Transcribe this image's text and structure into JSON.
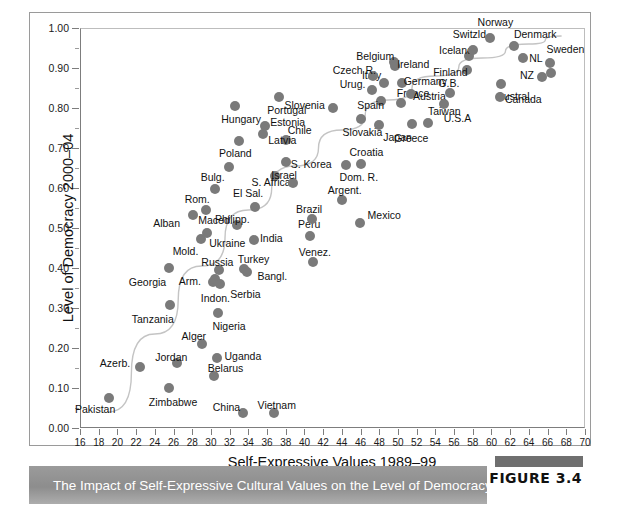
{
  "figure": {
    "caption": "The Impact of Self-Expressive Cultural Values on the Level of Democracy",
    "number_label": "FIGURE 3.4"
  },
  "chart_data": {
    "type": "scatter",
    "title": "",
    "xlabel": "Self-Expressive Values 1989–99",
    "ylabel": "Level of Democracy 2000–04",
    "xlim": [
      16,
      70
    ],
    "ylim": [
      0.0,
      1.0
    ],
    "xticks": [
      16,
      18,
      20,
      22,
      24,
      26,
      28,
      30,
      32,
      34,
      36,
      38,
      40,
      42,
      44,
      46,
      48,
      50,
      52,
      54,
      56,
      58,
      60,
      62,
      64,
      66,
      68,
      70
    ],
    "xtick_labels": [
      "16",
      "18",
      "20",
      "22",
      "24",
      "26",
      "28",
      "30",
      "32",
      "34",
      "36",
      "38",
      "40",
      "42",
      "44",
      "46",
      "48",
      "50",
      "52",
      "54",
      "56",
      "58",
      "60",
      "62",
      "64",
      "66",
      "68",
      "70"
    ],
    "yticks": [
      0.0,
      0.1,
      0.2,
      0.3,
      0.4,
      0.5,
      0.6,
      0.7,
      0.8,
      0.9,
      1.0
    ],
    "ytick_labels": [
      "0.00",
      "0.10",
      "0.20",
      "0.30",
      "0.40",
      "0.50",
      "0.60",
      "0.70",
      "0.80",
      "0.90",
      "1.00"
    ],
    "grid": false,
    "legend": "none",
    "marker_color": "#7a7a7a",
    "trendline": {
      "present": true,
      "color": "#c4c4c4",
      "description": "upward curving fitted line from lower-left to upper-right"
    },
    "points": [
      {
        "label": "Pakistan",
        "x": 19.1,
        "y": 0.075,
        "lx": -34,
        "ly": 11
      },
      {
        "label": "Azerb.",
        "x": 22.4,
        "y": 0.152,
        "lx": -40,
        "ly": -4
      },
      {
        "label": "Zimbabwe",
        "x": 25.5,
        "y": 0.1,
        "lx": -20,
        "ly": 14
      },
      {
        "label": "Tanzania",
        "x": 25.6,
        "y": 0.308,
        "lx": -38,
        "ly": 14
      },
      {
        "label": "Georgia",
        "x": 25.5,
        "y": 0.4,
        "lx": -40,
        "ly": 14
      },
      {
        "label": "Jordan",
        "x": 26.4,
        "y": 0.162,
        "lx": -22,
        "ly": -6
      },
      {
        "label": "Alger",
        "x": 29.0,
        "y": 0.21,
        "lx": -20,
        "ly": -8
      },
      {
        "label": "Belarus",
        "x": 30.3,
        "y": 0.13,
        "lx": -6,
        "ly": -8
      },
      {
        "label": "Uganda",
        "x": 30.7,
        "y": 0.176,
        "lx": 7,
        "ly": -2
      },
      {
        "label": "Nigeria",
        "x": 30.8,
        "y": 0.288,
        "lx": -6,
        "ly": 13
      },
      {
        "label": "China",
        "x": 33.4,
        "y": 0.037,
        "lx": -30,
        "ly": -6
      },
      {
        "label": "Vietnam",
        "x": 36.7,
        "y": 0.037,
        "lx": -16,
        "ly": -8
      },
      {
        "label": "Indon.",
        "x": 30.2,
        "y": 0.365,
        "lx": -12,
        "ly": 16
      },
      {
        "label": "Arm.",
        "x": 30.4,
        "y": 0.372,
        "lx": -36,
        "ly": 2
      },
      {
        "label": "Serbia",
        "x": 31.0,
        "y": 0.36,
        "lx": 10,
        "ly": 10
      },
      {
        "label": "Russia",
        "x": 30.9,
        "y": 0.395,
        "lx": -18,
        "ly": -8
      },
      {
        "label": "Bangl.",
        "x": 33.9,
        "y": 0.39,
        "lx": 10,
        "ly": 4
      },
      {
        "label": "Turkey",
        "x": 33.5,
        "y": 0.398,
        "lx": -6,
        "ly": -10
      },
      {
        "label": "Venez.",
        "x": 40.9,
        "y": 0.415,
        "lx": -14,
        "ly": -10
      },
      {
        "label": "Mold.",
        "x": 28.9,
        "y": 0.473,
        "lx": -28,
        "ly": 12
      },
      {
        "label": "Ukraine",
        "x": 29.6,
        "y": 0.488,
        "lx": 2,
        "ly": 10
      },
      {
        "label": "India",
        "x": 34.6,
        "y": 0.47,
        "lx": 6,
        "ly": -2
      },
      {
        "label": "Alban",
        "x": 28.1,
        "y": 0.532,
        "lx": -40,
        "ly": 8
      },
      {
        "label": "Maced.",
        "x": 29.5,
        "y": 0.545,
        "lx": -8,
        "ly": 10
      },
      {
        "label": "Philipp.",
        "x": 32.8,
        "y": 0.508,
        "lx": -22,
        "ly": -6
      },
      {
        "label": "Peru",
        "x": 40.6,
        "y": 0.48,
        "lx": -12,
        "ly": -12
      },
      {
        "label": "Brazil",
        "x": 40.8,
        "y": 0.523,
        "lx": -16,
        "ly": -10
      },
      {
        "label": "Mexico",
        "x": 45.9,
        "y": 0.512,
        "lx": 8,
        "ly": -8
      },
      {
        "label": "Rom.",
        "x": 30.4,
        "y": 0.598,
        "lx": -30,
        "ly": 10
      },
      {
        "label": "El Sal.",
        "x": 34.7,
        "y": 0.552,
        "lx": -22,
        "ly": -14
      },
      {
        "label": "S. Africa",
        "x": 36.9,
        "y": 0.63,
        "lx": -24,
        "ly": 6
      },
      {
        "label": "Bulg.",
        "x": 31.9,
        "y": 0.652,
        "lx": -28,
        "ly": 10
      },
      {
        "label": "Argent.",
        "x": 44.0,
        "y": 0.57,
        "lx": -14,
        "ly": -10
      },
      {
        "label": "Dom. R.",
        "x": 44.4,
        "y": 0.658,
        "lx": -6,
        "ly": 12
      },
      {
        "label": "Israel",
        "x": 38.8,
        "y": 0.612,
        "lx": -22,
        "ly": -8
      },
      {
        "label": "S. Korea",
        "x": 38.0,
        "y": 0.665,
        "lx": 5,
        "ly": 2
      },
      {
        "label": "Chile",
        "x": 38.0,
        "y": 0.72,
        "lx": 2,
        "ly": -10
      },
      {
        "label": "Croatia",
        "x": 46.1,
        "y": 0.66,
        "lx": -12,
        "ly": -12
      },
      {
        "label": "Poland",
        "x": 33.0,
        "y": 0.718,
        "lx": -20,
        "ly": 12
      },
      {
        "label": "Latvia",
        "x": 35.6,
        "y": 0.735,
        "lx": 5,
        "ly": 6
      },
      {
        "label": "Estonia",
        "x": 35.8,
        "y": 0.755,
        "lx": 5,
        "ly": -4
      },
      {
        "label": "Hungary",
        "x": 32.6,
        "y": 0.805,
        "lx": -14,
        "ly": 13
      },
      {
        "label": "Portugal",
        "x": 37.3,
        "y": 0.828,
        "lx": -12,
        "ly": 13
      },
      {
        "label": "Slovenia",
        "x": 43.0,
        "y": 0.8,
        "lx": -48,
        "ly": -3
      },
      {
        "label": "Slovakia",
        "x": 46.0,
        "y": 0.772,
        "lx": -18,
        "ly": 13
      },
      {
        "label": "Japan",
        "x": 48.0,
        "y": 0.758,
        "lx": 4,
        "ly": 12
      },
      {
        "label": "Greece",
        "x": 51.5,
        "y": 0.76,
        "lx": -18,
        "ly": 14
      },
      {
        "label": "Taiwan",
        "x": 53.2,
        "y": 0.762,
        "lx": 0,
        "ly": -12
      },
      {
        "label": "Urug.",
        "x": 47.2,
        "y": 0.845,
        "lx": -32,
        "ly": -6
      },
      {
        "label": "Spain",
        "x": 48.2,
        "y": 0.818,
        "lx": -24,
        "ly": 4
      },
      {
        "label": "France",
        "x": 50.3,
        "y": 0.812,
        "lx": -4,
        "ly": -10
      },
      {
        "label": "Italy",
        "x": 48.5,
        "y": 0.862,
        "lx": -22,
        "ly": -8
      },
      {
        "label": "Czech R.",
        "x": 47.3,
        "y": 0.88,
        "lx": -40,
        "ly": -6
      },
      {
        "label": "Germany",
        "x": 50.4,
        "y": 0.862,
        "lx": 2,
        "ly": -2
      },
      {
        "label": "Austria",
        "x": 51.4,
        "y": 0.835,
        "lx": 2,
        "ly": 2
      },
      {
        "label": "Belgium",
        "x": 49.6,
        "y": 0.915,
        "lx": -38,
        "ly": -6
      },
      {
        "label": "Ireland",
        "x": 49.7,
        "y": 0.905,
        "lx": 2,
        "ly": -2
      },
      {
        "label": "U.S.A",
        "x": 54.9,
        "y": 0.81,
        "lx": 0,
        "ly": 14
      },
      {
        "label": "G.B.",
        "x": 55.6,
        "y": 0.838,
        "lx": -12,
        "ly": -10
      },
      {
        "label": "Finland",
        "x": 57.4,
        "y": 0.895,
        "lx": -34,
        "ly": 2
      },
      {
        "label": "Iceland",
        "x": 57.6,
        "y": 0.93,
        "lx": -30,
        "ly": -6
      },
      {
        "label": "Switzld.",
        "x": 58.0,
        "y": 0.945,
        "lx": -20,
        "ly": -16
      },
      {
        "label": "Norway",
        "x": 59.8,
        "y": 0.975,
        "lx": -12,
        "ly": -16
      },
      {
        "label": "Denmark",
        "x": 62.4,
        "y": 0.955,
        "lx": 0,
        "ly": -12
      },
      {
        "label": "NL",
        "x": 63.4,
        "y": 0.925,
        "lx": 6,
        "ly": 0
      },
      {
        "label": "Austral.",
        "x": 61.0,
        "y": 0.86,
        "lx": -4,
        "ly": 12
      },
      {
        "label": "Canada",
        "x": 60.9,
        "y": 0.828,
        "lx": 5,
        "ly": 2
      },
      {
        "label": "NZ",
        "x": 65.4,
        "y": 0.878,
        "lx": -22,
        "ly": -2
      },
      {
        "label": "Sweden",
        "x": 66.3,
        "y": 0.912,
        "lx": -4,
        "ly": -14
      },
      {
        "label": "Sweden2",
        "x": 66.4,
        "y": 0.888,
        "lx": -999,
        "ly": -999
      }
    ]
  }
}
